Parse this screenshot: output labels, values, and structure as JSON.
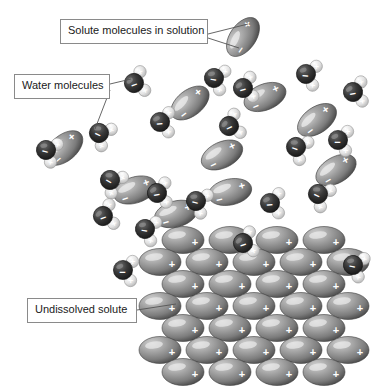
{
  "figure": {
    "background_color": "#ffffff",
    "width": 390,
    "height": 386
  },
  "labels": [
    {
      "id": "solute-in-solution",
      "text": "Solute molecules in solution",
      "x": 60,
      "y": 19,
      "width": 148,
      "height": 25
    },
    {
      "id": "water-molecules",
      "text": "Water molecules",
      "x": 14,
      "y": 74,
      "width": 96,
      "height": 25
    },
    {
      "id": "undissolved-solute",
      "text": "Undissolved solute",
      "x": 27,
      "y": 298,
      "width": 110,
      "height": 25
    }
  ],
  "leader_lines": [
    {
      "from_label": "solute-in-solution",
      "x1": 208,
      "y1": 34,
      "x2": 248,
      "y2": 24
    },
    {
      "from_label": "solute-in-solution",
      "x1": 208,
      "y1": 38,
      "x2": 239,
      "y2": 48
    },
    {
      "from_label": "water-molecules",
      "x1": 110,
      "y1": 84,
      "x2": 131,
      "y2": 79
    },
    {
      "from_label": "water-molecules",
      "x1": 110,
      "y1": 90,
      "x2": 95,
      "y2": 129
    },
    {
      "from_label": "undissolved-solute",
      "x1": 137,
      "y1": 310,
      "x2": 176,
      "y2": 304
    }
  ],
  "colors": {
    "solute_ellipse_light": "#b9b9b9",
    "solute_ellipse_mid": "#8f8f8f",
    "solute_ellipse_dark": "#4e4e4e",
    "oxygen_dark": "#2b2b2b",
    "oxygen_mid": "#555555",
    "hydrogen_light": "#f0f0f0",
    "hydrogen_mid": "#c8c8c8",
    "charge_sign": "#ffffff",
    "label_border": "#8a8a8a",
    "label_text": "#1a1a1a",
    "leader_line": "#555555"
  },
  "legend_semantics": {
    "water_molecule": "dark oxygen sphere marked minus with two pale hydrogen spheres marked plus",
    "solute_molecule": "gray ellipse with plus at one pole and minus at the other",
    "lattice": "ordered staggered array of solute ellipses forming undissolved crystal"
  },
  "charge_symbols": {
    "positive": "+",
    "negative": "−"
  },
  "water_molecules": [
    {
      "x": 134,
      "y": 83,
      "rot": -20
    },
    {
      "x": 99,
      "y": 133,
      "rot": 25
    },
    {
      "x": 160,
      "y": 122,
      "rot": -5
    },
    {
      "x": 46,
      "y": 150,
      "rot": 15
    },
    {
      "x": 214,
      "y": 78,
      "rot": 10
    },
    {
      "x": 243,
      "y": 88,
      "rot": -15
    },
    {
      "x": 306,
      "y": 74,
      "rot": 5
    },
    {
      "x": 353,
      "y": 92,
      "rot": -10
    },
    {
      "x": 296,
      "y": 147,
      "rot": 20
    },
    {
      "x": 229,
      "y": 126,
      "rot": -25
    },
    {
      "x": 338,
      "y": 140,
      "rot": 0
    },
    {
      "x": 110,
      "y": 180,
      "rot": 30
    },
    {
      "x": 157,
      "y": 193,
      "rot": -10
    },
    {
      "x": 196,
      "y": 201,
      "rot": 15
    },
    {
      "x": 103,
      "y": 216,
      "rot": -20
    },
    {
      "x": 145,
      "y": 229,
      "rot": 10
    },
    {
      "x": 270,
      "y": 203,
      "rot": -5
    },
    {
      "x": 318,
      "y": 194,
      "rot": 25
    },
    {
      "x": 123,
      "y": 270,
      "rot": 0
    },
    {
      "x": 243,
      "y": 243,
      "rot": -18
    },
    {
      "x": 353,
      "y": 265,
      "rot": 12
    }
  ],
  "free_solute_molecules": [
    {
      "x": 243,
      "y": 37,
      "rot": -55
    },
    {
      "x": 190,
      "y": 103,
      "rot": -38
    },
    {
      "x": 64,
      "y": 148,
      "rot": -40
    },
    {
      "x": 265,
      "y": 97,
      "rot": -22
    },
    {
      "x": 317,
      "y": 120,
      "rot": -35
    },
    {
      "x": 222,
      "y": 155,
      "rot": -25
    },
    {
      "x": 135,
      "y": 190,
      "rot": -18
    },
    {
      "x": 230,
      "y": 192,
      "rot": -12
    },
    {
      "x": 176,
      "y": 214,
      "rot": -15
    },
    {
      "x": 336,
      "y": 170,
      "rot": -30
    }
  ],
  "lattice": {
    "ellipse_rx": 21,
    "ellipse_ry": 13.5,
    "row_spacing": 22,
    "col_spacing": 47,
    "start_y": 240,
    "rows": [
      {
        "count": 4,
        "start_x": 183
      },
      {
        "count": 5,
        "start_x": 160
      },
      {
        "count": 4,
        "start_x": 183
      },
      {
        "count": 5,
        "start_x": 160
      },
      {
        "count": 4,
        "start_x": 183
      },
      {
        "count": 5,
        "start_x": 160
      },
      {
        "count": 4,
        "start_x": 183
      }
    ]
  }
}
